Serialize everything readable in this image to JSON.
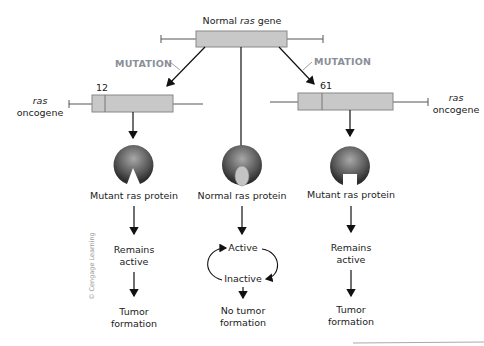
{
  "diagram": {
    "top_gene": {
      "label_prefix": "Normal ",
      "label_italic": "ras",
      "label_suffix": " gene"
    },
    "mutation_label": "MUTATION",
    "left_oncogene": {
      "italic": "ras",
      "label": "oncogene",
      "codon": "12"
    },
    "right_oncogene": {
      "italic": "ras",
      "label": "oncogene",
      "codon": "61"
    },
    "proteins": [
      {
        "label": "Mutant ras protein",
        "shape": "wedge-notch"
      },
      {
        "label": "Normal ras protein",
        "shape": "oval-bound"
      },
      {
        "label": "Mutant ras protein",
        "shape": "square-notch"
      }
    ],
    "outcomes": {
      "left": {
        "state_line1": "Remains",
        "state_line2": "active",
        "result_line1": "Tumor",
        "result_line2": "formation"
      },
      "center": {
        "cycle_top": "Active",
        "cycle_bottom": "Inactive",
        "result_line1": "No tumor",
        "result_line2": "formation"
      },
      "right": {
        "state_line1": "Remains",
        "state_line2": "active",
        "result_line1": "Tumor",
        "result_line2": "formation"
      }
    },
    "credit": "© Cengage Learning",
    "colors": {
      "gene_box": "#c8c8c8",
      "gene_border": "#8a8a8a",
      "mutation_text": "#8a8f96",
      "protein_dark": "#3a3a3a",
      "protein_light": "#9a9a9a"
    }
  }
}
